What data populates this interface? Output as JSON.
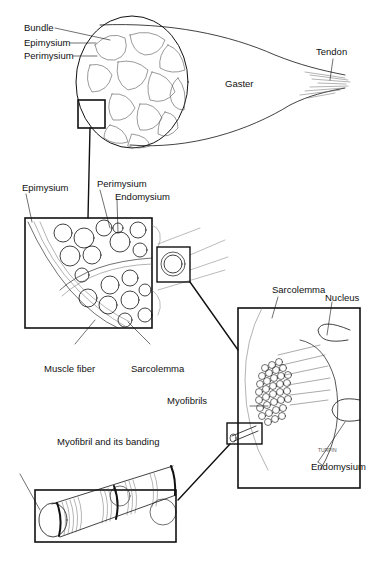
{
  "diagram": {
    "labels": {
      "bundle": "Bundle",
      "epimysium_top": "Epimysium",
      "perimysium_top": "Perimysium",
      "gaster": "Gaster",
      "tendon": "Tendon",
      "epimysium_mid": "Epimysium",
      "perimysium_mid": "Perimysium",
      "endomysium_mid": "Endomysium",
      "muscle_fiber": "Muscle fiber",
      "sarcolemma_mid": "Sarcolemma",
      "sarcolemma_right": "Sarcolemma",
      "nucleus": "Nucleus",
      "myofibrils": "Myofibrils",
      "endomysium_right": "Endomysium",
      "myofibril_banding": "Myofibril and its banding",
      "artist_signature": "TURPIN"
    },
    "panels": [
      {
        "id": "whole-muscle",
        "name": "Whole muscle (gaster with tendon)"
      },
      {
        "id": "bundle-detail",
        "name": "Cross-section detail of bundles"
      },
      {
        "id": "fiber-detail",
        "name": "Muscle fiber with myofibrils"
      },
      {
        "id": "myofibril-detail",
        "name": "Myofibril banding"
      }
    ]
  }
}
